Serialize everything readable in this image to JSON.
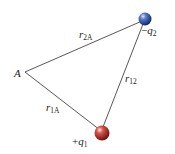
{
  "diagram": {
    "points": {
      "A": {
        "label": "A",
        "x": 25,
        "y": 72
      },
      "q1": {
        "sign": "+",
        "name": "q",
        "sub": "1",
        "x": 102,
        "y": 133,
        "color": "#b02a1e"
      },
      "q2": {
        "sign": "−",
        "name": "q",
        "sub": "2",
        "x": 145,
        "y": 19,
        "color": "#1f3c8c"
      }
    },
    "distances": {
      "r2A": {
        "name": "r",
        "sub": "2A"
      },
      "r12": {
        "name": "r",
        "sub": "12"
      },
      "r1A": {
        "name": "r",
        "sub": "1A"
      }
    },
    "line_color": "#444444"
  }
}
